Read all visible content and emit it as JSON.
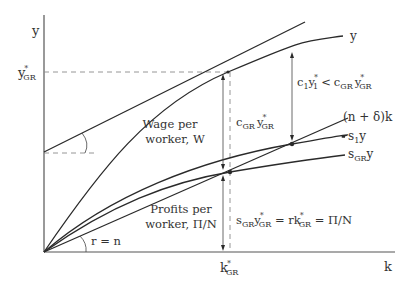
{
  "diagram": {
    "axes": {
      "y_label": "y",
      "x_label": "k",
      "y_tick": {
        "base": "y",
        "sup": "*",
        "sub": "GR"
      },
      "x_tick": {
        "base": "k",
        "sup": "*",
        "sub": "GR"
      }
    },
    "curves": {
      "production": "y",
      "depreciation": "(n + δ)k",
      "savings_1": {
        "base": "s",
        "sub": "1",
        "tail": "y"
      },
      "savings_gr": {
        "base": "s",
        "sub": "GR",
        "tail": "y"
      }
    },
    "annotations": {
      "wage_line1": "Wage per",
      "wage_line2": "worker, W",
      "profits_line1": "Profits per",
      "profits_line2": "worker, Π/N",
      "consumption_gr": {
        "c": "c",
        "c_sub": "GR",
        "y": "y",
        "y_sup": "*",
        "y_sub": "GR"
      },
      "comparison": {
        "c1": "c",
        "c1_sub": "1",
        "y1": "y",
        "y1_sup": "*",
        "y1_sub": "1",
        "op": "<",
        "c2": "c",
        "c2_sub": "GR",
        "y2": "y",
        "y2_sup": "*",
        "y2_sub": "GR"
      },
      "profits_eq": {
        "s": "s",
        "s_sub": "GR",
        "y": "y",
        "y_sup": "*",
        "y_sub": "GR",
        "eq1": " = rk",
        "k_sup": "*",
        "k_sub": "GR",
        "eq2": " = Π/N"
      },
      "slope_label": "r = n"
    },
    "colors": {
      "line": "#2a2a2a",
      "axis": "#555555",
      "dashed": "#8a8a8a",
      "text": "#333333"
    }
  }
}
